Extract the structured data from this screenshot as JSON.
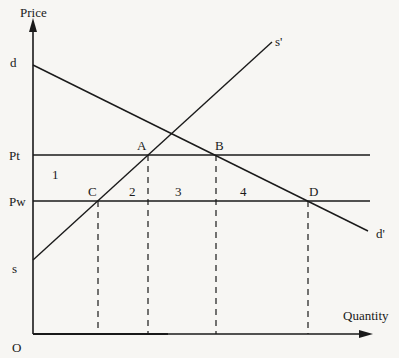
{
  "diagram": {
    "type": "supply-demand tariff diagram",
    "axes": {
      "y_label": "Price",
      "x_label": "Quantity",
      "origin_label": "O"
    },
    "price_levels": [
      {
        "label": "Pt",
        "meaning": "price with tariff"
      },
      {
        "label": "Pw",
        "meaning": "world price"
      }
    ],
    "curves": [
      {
        "name": "demand",
        "start_label": "d",
        "end_label": "d'"
      },
      {
        "name": "supply",
        "start_label": "s",
        "end_label": "s'"
      }
    ],
    "points": [
      {
        "label": "A",
        "on": "Pt ∩ supply"
      },
      {
        "label": "B",
        "on": "Pt ∩ demand"
      },
      {
        "label": "C",
        "on": "Pw ∩ supply"
      },
      {
        "label": "D",
        "on": "Pw ∩ demand"
      }
    ],
    "areas": [
      "1",
      "2",
      "3",
      "4"
    ]
  }
}
